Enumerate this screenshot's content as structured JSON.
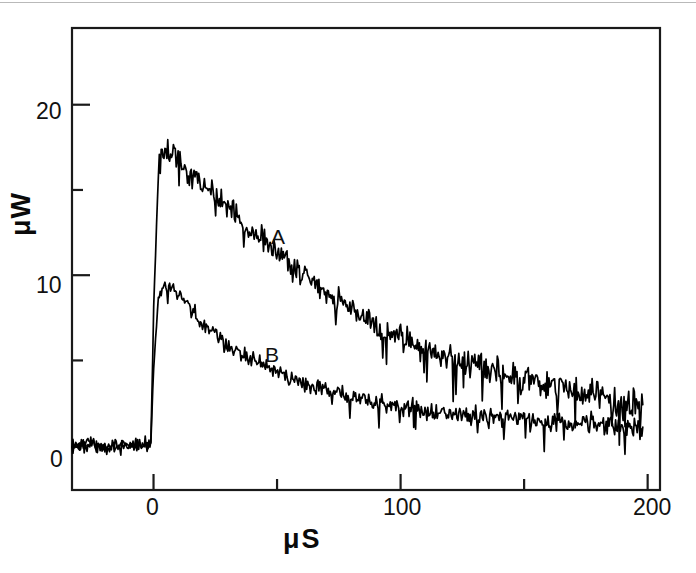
{
  "figure": {
    "width": 696,
    "height": 573,
    "background": "#ffffff",
    "line_color": "#000000",
    "axis_color": "#1a1a1a"
  },
  "axes": {
    "x_title": "μS",
    "y_title": "μW",
    "x_major_ticks": [
      {
        "value": 0,
        "label": "0"
      },
      {
        "value": 100,
        "label": "100"
      },
      {
        "value": 200,
        "label": "200"
      }
    ],
    "x_minor_ticks": [
      50,
      150
    ],
    "y_major_ticks": [
      {
        "value": 0,
        "label": "0"
      },
      {
        "value": 10,
        "label": "10"
      },
      {
        "value": 20,
        "label": "20"
      }
    ],
    "y_minor_ticks": [
      5,
      15
    ]
  },
  "annotations": [
    {
      "text": "A",
      "series": "A"
    },
    {
      "text": "B",
      "series": "B"
    }
  ],
  "chart_data": {
    "type": "line",
    "title": "",
    "subtitle": "",
    "xlabel": "μS",
    "ylabel": "μW",
    "xlim": [
      -33,
      205
    ],
    "ylim": [
      -2.6,
      24.5
    ],
    "grid": false,
    "legend": "inline-annotations",
    "x_tick_labels": [
      "0",
      "100",
      "200"
    ],
    "y_tick_labels": [
      "0",
      "10",
      "20"
    ],
    "series": [
      {
        "name": "A",
        "color": "#000000",
        "label_text": "A",
        "label_x": 52,
        "label_y": 13.0,
        "peak_value": 17.6,
        "peak_x": 4,
        "baseline_value": 0.0,
        "x": [
          -33,
          -30,
          -25,
          -20,
          -15,
          -10,
          -5,
          -1,
          0,
          2,
          4,
          6,
          8,
          10,
          15,
          20,
          25,
          30,
          35,
          40,
          45,
          50,
          55,
          60,
          65,
          70,
          75,
          80,
          85,
          90,
          95,
          100,
          105,
          110,
          115,
          120,
          125,
          130,
          135,
          140,
          145,
          150,
          155,
          160,
          165,
          170,
          175,
          180,
          185,
          190,
          195,
          198
        ],
        "y": [
          0.1,
          0.0,
          0.2,
          -0.1,
          0.1,
          0.0,
          0.1,
          0.0,
          8.0,
          16.0,
          17.6,
          17.2,
          17.4,
          16.8,
          16.0,
          15.4,
          14.7,
          14.0,
          13.3,
          12.6,
          12.0,
          11.4,
          10.8,
          10.2,
          9.6,
          9.0,
          8.5,
          8.0,
          7.5,
          7.1,
          6.7,
          6.3,
          6.0,
          5.7,
          5.4,
          5.1,
          4.9,
          4.7,
          4.5,
          4.3,
          4.1,
          4.0,
          3.8,
          3.6,
          3.4,
          3.2,
          3.0,
          2.8,
          2.6,
          2.5,
          2.4,
          2.3
        ]
      },
      {
        "name": "B",
        "color": "#000000",
        "label_text": "B",
        "label_x": 49,
        "label_y": 6.2,
        "peak_value": 9.5,
        "peak_x": 4,
        "baseline_value": 0.0,
        "x": [
          -33,
          -30,
          -25,
          -20,
          -15,
          -10,
          -5,
          -1,
          0,
          2,
          4,
          6,
          8,
          10,
          15,
          20,
          25,
          30,
          35,
          40,
          45,
          50,
          55,
          60,
          65,
          70,
          75,
          80,
          85,
          90,
          95,
          100,
          105,
          110,
          115,
          120,
          125,
          130,
          135,
          140,
          145,
          150,
          155,
          160,
          165,
          170,
          175,
          180,
          185,
          190,
          195,
          198
        ],
        "y": [
          -0.2,
          -0.1,
          0.1,
          -0.2,
          0.0,
          -0.1,
          0.1,
          -0.1,
          4.5,
          8.8,
          9.5,
          9.2,
          9.3,
          8.9,
          8.0,
          7.2,
          6.5,
          5.9,
          5.4,
          5.0,
          4.6,
          4.3,
          4.0,
          3.7,
          3.5,
          3.3,
          3.1,
          2.9,
          2.7,
          2.6,
          2.4,
          2.3,
          2.2,
          2.1,
          2.0,
          1.9,
          1.8,
          1.75,
          1.7,
          1.65,
          1.6,
          1.55,
          1.5,
          1.45,
          1.4,
          1.35,
          1.3,
          1.25,
          1.2,
          1.15,
          1.1,
          1.05
        ]
      }
    ]
  }
}
